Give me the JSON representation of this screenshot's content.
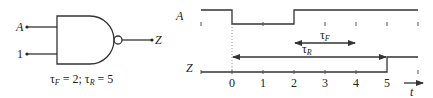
{
  "gate": {
    "type": "NAND",
    "inputs": [
      {
        "label": "A",
        "y": 27
      },
      {
        "label": "1",
        "y": 54
      }
    ],
    "output": {
      "label": "Z"
    },
    "caption": {
      "tau_f_symbol": "τ",
      "tau_f_sub": "F",
      "tau_f_value": " = 2; ",
      "tau_r_symbol": "τ",
      "tau_r_sub": "R",
      "tau_r_value": " = 5"
    },
    "tau_F": 2,
    "tau_R": 5
  },
  "timing": {
    "signal_A_label": "A",
    "signal_Z_label": "Z",
    "time_axis_label": "t",
    "tick_labels": [
      "0",
      "1",
      "2",
      "3",
      "4",
      "5"
    ],
    "tau_F_label": {
      "symbol": "τ",
      "sub": "F"
    },
    "tau_R_label": {
      "symbol": "τ",
      "sub": "R"
    },
    "signal_A": [
      {
        "from": -1,
        "to": 0,
        "level": 1
      },
      {
        "from": 0,
        "to": 2,
        "level": 0
      },
      {
        "from": 2,
        "to": 6,
        "level": 1
      }
    ],
    "signal_Z": [
      {
        "from": -1,
        "to": 5,
        "level": 0
      },
      {
        "from": 5,
        "to": 6,
        "level": 1
      }
    ],
    "tau_F_span": [
      2,
      4
    ],
    "tau_R_span": [
      0,
      5
    ]
  }
}
